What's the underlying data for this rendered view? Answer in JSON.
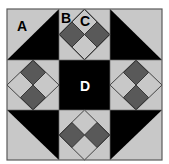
{
  "diagram": {
    "type": "quilt-block",
    "grid": "3x3",
    "labels": {
      "a": "A",
      "b": "B",
      "c": "C",
      "d": "D"
    },
    "colors": {
      "light": "#c8c8c8",
      "dark": "#000000",
      "medium": "#595959",
      "border": "#5a5a5a",
      "label_dark": "#000000",
      "label_light": "#ffffff"
    },
    "patches": [
      {
        "position": "top-left",
        "kind": "half-square-triangle",
        "label": "A"
      },
      {
        "position": "top-center",
        "kind": "square-in-square",
        "labels": [
          "B",
          "C"
        ]
      },
      {
        "position": "top-right",
        "kind": "half-square-triangle"
      },
      {
        "position": "middle-left",
        "kind": "square-in-square"
      },
      {
        "position": "center",
        "kind": "solid-square",
        "label": "D"
      },
      {
        "position": "middle-right",
        "kind": "square-in-square"
      },
      {
        "position": "bottom-left",
        "kind": "half-square-triangle"
      },
      {
        "position": "bottom-center",
        "kind": "square-in-square"
      },
      {
        "position": "bottom-right",
        "kind": "half-square-triangle"
      }
    ]
  }
}
